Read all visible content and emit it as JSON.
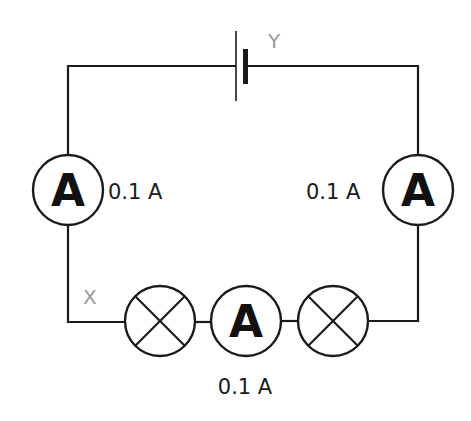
{
  "diagram": {
    "type": "series circuit",
    "colors": {
      "wire": "#1a1a1a",
      "point_label": "#9a9a9a"
    },
    "cell": {
      "name": "cell"
    },
    "points": [
      {
        "id": "X",
        "label": "X"
      },
      {
        "id": "Y",
        "label": "Y"
      }
    ],
    "ammeters": [
      {
        "id": "left",
        "symbol": "A",
        "reading": "0.1 A"
      },
      {
        "id": "right",
        "symbol": "A",
        "reading": "0.1 A"
      },
      {
        "id": "bottom",
        "symbol": "A",
        "reading": "0.1 A"
      }
    ],
    "lamps": [
      {
        "id": "lamp-1"
      },
      {
        "id": "lamp-2"
      }
    ]
  }
}
